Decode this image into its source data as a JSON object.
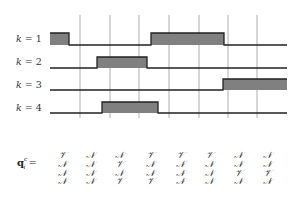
{
  "diagram": {
    "type": "timing-diagram",
    "time_axis": {
      "x_start": 50,
      "x_end": 287,
      "gridlines_x": [
        80,
        110,
        139,
        169,
        199,
        228,
        257
      ],
      "gridline_top": 15,
      "gridline_bottom": 118
    },
    "colors": {
      "pulse_fill": "#808080",
      "line": "#222222",
      "gridline": "#999999",
      "text": "#333333"
    },
    "signals": [
      {
        "label": "k = 1",
        "k": "1",
        "baseline_y": 45,
        "high_y": 33,
        "label_y": 38,
        "pulses": [
          [
            50,
            69
          ],
          [
            151,
            224
          ]
        ]
      },
      {
        "label": "k = 2",
        "k": "2",
        "baseline_y": 68,
        "high_y": 57,
        "label_y": 61,
        "pulses": [
          [
            97,
            147
          ]
        ]
      },
      {
        "label": "k = 3",
        "k": "3",
        "baseline_y": 90,
        "high_y": 79,
        "label_y": 84,
        "pulses": [
          [
            223,
            287
          ]
        ]
      },
      {
        "label": "k = 4",
        "k": "4",
        "baseline_y": 113,
        "high_y": 102,
        "label_y": 107,
        "pulses": [
          [
            102,
            158
          ]
        ]
      }
    ],
    "matrix": {
      "label_main": "q",
      "label_sup": "c",
      "label_sub": "i",
      "label_eq": " =",
      "column_x": [
        62,
        90,
        119,
        150,
        180,
        209,
        238,
        267
      ],
      "row_y": [
        155,
        164,
        173,
        181
      ],
      "rows": [
        [
          "V",
          "N",
          "N",
          "V",
          "V",
          "V",
          "N",
          "N"
        ],
        [
          "N",
          "N",
          "V",
          "N",
          "N",
          "N",
          "N",
          "N"
        ],
        [
          "N",
          "N",
          "N",
          "N",
          "N",
          "N",
          "V",
          "V"
        ],
        [
          "N",
          "N",
          "V",
          "V",
          "N",
          "N",
          "N",
          "N"
        ]
      ],
      "symbols": {
        "V": "𝒱",
        "N": "𝒩"
      }
    }
  }
}
